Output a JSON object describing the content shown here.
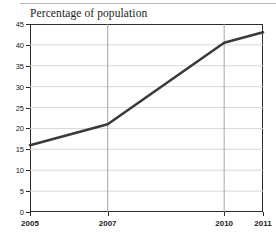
{
  "chart_data": {
    "type": "line",
    "title": "Percentage of population",
    "xlabel": "",
    "ylabel": "",
    "x": [
      2005,
      2007,
      2010,
      2011
    ],
    "values": [
      16,
      21,
      40.5,
      43
    ],
    "series": [
      {
        "name": "Percentage of population",
        "values": [
          16,
          21,
          40.5,
          43
        ],
        "color": "#3a3a3a"
      }
    ],
    "xtick_labels": [
      "2005",
      "2007",
      "2010",
      "2011"
    ],
    "xtick_values": [
      2005,
      2007,
      2010,
      2011
    ],
    "ytick_labels": [
      "0",
      "5",
      "10",
      "15",
      "20",
      "25",
      "30",
      "35",
      "40",
      "45"
    ],
    "ytick_values": [
      0,
      5,
      10,
      15,
      20,
      25,
      30,
      35,
      40,
      45
    ],
    "xlim": [
      2005,
      2011
    ],
    "ylim": [
      0,
      45
    ],
    "grid": "horizontal-and-vertical",
    "grid_color": "#d4d4d4",
    "legend": "none",
    "line_color": "#3a3a3a",
    "line_width": 2.6,
    "background_color": "#ffffff",
    "frame_color": "#2b2b2b"
  }
}
